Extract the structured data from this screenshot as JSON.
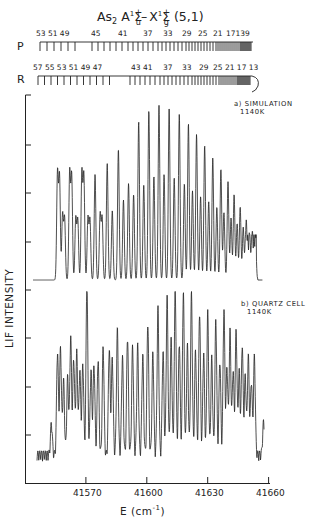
{
  "title": {
    "molecule": "As",
    "molecule_sub": "2",
    "upper_state": "A",
    "upper_mult": "1",
    "upper_sym": "Σ",
    "upper_sup": "+",
    "upper_sub": "u",
    "dash": "–",
    "lower_state": "X",
    "lower_mult": "1",
    "lower_sym": "Σ",
    "lower_sup": "+",
    "lower_sub": "g",
    "band": "(5,1)"
  },
  "chart_data": [
    {
      "type": "line",
      "title": "As2 A1Σu+ – X1Σg+ (5,1)",
      "panel": "a) SIMULATION 1140K",
      "xlabel": "E (cm-1)",
      "ylabel": "LIF INTENSITY",
      "xlim": [
        41540,
        41661
      ],
      "x_ticks": [
        41570,
        41600,
        41630,
        41660
      ],
      "grid": false,
      "band_head_cm": 41654,
      "description": "Resolved rotational lines of P and R branches; intensity rises toward ~41610 and decays into a congested band head near 41654",
      "peaks": [
        {
          "x": 41556,
          "y": 0.59
        },
        {
          "x": 41557,
          "y": 0.57
        },
        {
          "x": 41558.5,
          "y": 0.36
        },
        {
          "x": 41559.5,
          "y": 0.34
        },
        {
          "x": 41562,
          "y": 0.59
        },
        {
          "x": 41563,
          "y": 0.57
        },
        {
          "x": 41565,
          "y": 0.34
        },
        {
          "x": 41566,
          "y": 0.33
        },
        {
          "x": 41568,
          "y": 0.59
        },
        {
          "x": 41569,
          "y": 0.57
        },
        {
          "x": 41571,
          "y": 0.34
        },
        {
          "x": 41572,
          "y": 0.33
        },
        {
          "x": 41574.5,
          "y": 0.58
        },
        {
          "x": 41577,
          "y": 0.36
        },
        {
          "x": 41578,
          "y": 0.34
        },
        {
          "x": 41580.5,
          "y": 0.64
        },
        {
          "x": 41583,
          "y": 0.38
        },
        {
          "x": 41586,
          "y": 0.72
        },
        {
          "x": 41588.5,
          "y": 0.44
        },
        {
          "x": 41591,
          "y": 0.53
        },
        {
          "x": 41593.5,
          "y": 0.47
        },
        {
          "x": 41596,
          "y": 0.87
        },
        {
          "x": 41598.5,
          "y": 0.52
        },
        {
          "x": 41601,
          "y": 0.93
        },
        {
          "x": 41603.5,
          "y": 0.57
        },
        {
          "x": 41606,
          "y": 0.96
        },
        {
          "x": 41608.5,
          "y": 0.58
        },
        {
          "x": 41611,
          "y": 0.95
        },
        {
          "x": 41613.5,
          "y": 0.56
        },
        {
          "x": 41616,
          "y": 0.91
        },
        {
          "x": 41618.5,
          "y": 0.53
        },
        {
          "x": 41620.5,
          "y": 0.86
        },
        {
          "x": 41622.5,
          "y": 0.49
        },
        {
          "x": 41624.5,
          "y": 0.8
        },
        {
          "x": 41626.5,
          "y": 0.46
        },
        {
          "x": 41628.5,
          "y": 0.74
        },
        {
          "x": 41630.5,
          "y": 0.43
        },
        {
          "x": 41632.5,
          "y": 0.67
        },
        {
          "x": 41634.5,
          "y": 0.4
        },
        {
          "x": 41636.5,
          "y": 0.61
        },
        {
          "x": 41638,
          "y": 0.37
        },
        {
          "x": 41640,
          "y": 0.54
        },
        {
          "x": 41641.5,
          "y": 0.34
        },
        {
          "x": 41643,
          "y": 0.47
        },
        {
          "x": 41644.5,
          "y": 0.31
        },
        {
          "x": 41646,
          "y": 0.4
        },
        {
          "x": 41647.5,
          "y": 0.29
        },
        {
          "x": 41649,
          "y": 0.33
        },
        {
          "x": 41650.5,
          "y": 0.26
        },
        {
          "x": 41652,
          "y": 0.27
        },
        {
          "x": 41653.5,
          "y": 0.25
        }
      ]
    },
    {
      "type": "line",
      "panel": "b) QUARTZ CELL 1140K",
      "xlabel": "E (cm-1)",
      "ylabel": "LIF INTENSITY",
      "xlim": [
        41540,
        41661
      ],
      "x_ticks": [
        41570,
        41600,
        41630,
        41660
      ],
      "grid": false,
      "band_head_cm": 41654,
      "description": "Experimental LIF spectrum; noisier lines, strong isolated line near 41565, drop at band head then small feature near 41658",
      "peaks": [
        {
          "x": 41553,
          "y": 0.18
        },
        {
          "x": 41556,
          "y": 0.59
        },
        {
          "x": 41557.5,
          "y": 0.61
        },
        {
          "x": 41559,
          "y": 0.42
        },
        {
          "x": 41561,
          "y": 0.44
        },
        {
          "x": 41562.5,
          "y": 0.67
        },
        {
          "x": 41564,
          "y": 0.55
        },
        {
          "x": 41565.5,
          "y": 0.58
        },
        {
          "x": 41567,
          "y": 0.48
        },
        {
          "x": 41568.5,
          "y": 0.52
        },
        {
          "x": 41570.5,
          "y": 0.98
        },
        {
          "x": 41572.5,
          "y": 0.48
        },
        {
          "x": 41574,
          "y": 0.52
        },
        {
          "x": 41576,
          "y": 0.55
        },
        {
          "x": 41578.5,
          "y": 0.62
        },
        {
          "x": 41581.5,
          "y": 0.61
        },
        {
          "x": 41583,
          "y": 0.55
        },
        {
          "x": 41585.5,
          "y": 0.71
        },
        {
          "x": 41588,
          "y": 0.56
        },
        {
          "x": 41590.5,
          "y": 0.68
        },
        {
          "x": 41593,
          "y": 0.62
        },
        {
          "x": 41595.5,
          "y": 0.62
        },
        {
          "x": 41598,
          "y": 0.57
        },
        {
          "x": 41600.5,
          "y": 0.76
        },
        {
          "x": 41603,
          "y": 0.58
        },
        {
          "x": 41605.5,
          "y": 0.83
        },
        {
          "x": 41608,
          "y": 0.59
        },
        {
          "x": 41610,
          "y": 0.9
        },
        {
          "x": 41612,
          "y": 0.66
        },
        {
          "x": 41614,
          "y": 0.95
        },
        {
          "x": 41616,
          "y": 0.65
        },
        {
          "x": 41618,
          "y": 0.93
        },
        {
          "x": 41620,
          "y": 0.62
        },
        {
          "x": 41622,
          "y": 0.92
        },
        {
          "x": 41624,
          "y": 0.6
        },
        {
          "x": 41626,
          "y": 0.82
        },
        {
          "x": 41628,
          "y": 0.58
        },
        {
          "x": 41630,
          "y": 0.81
        },
        {
          "x": 41632,
          "y": 0.55
        },
        {
          "x": 41634,
          "y": 0.77
        },
        {
          "x": 41636,
          "y": 0.54
        },
        {
          "x": 41638,
          "y": 0.83
        },
        {
          "x": 41639.5,
          "y": 0.5
        },
        {
          "x": 41641,
          "y": 0.7
        },
        {
          "x": 41642.5,
          "y": 0.48
        },
        {
          "x": 41644,
          "y": 0.71
        },
        {
          "x": 41645.5,
          "y": 0.47
        },
        {
          "x": 41647,
          "y": 0.63
        },
        {
          "x": 41648.5,
          "y": 0.45
        },
        {
          "x": 41650,
          "y": 0.56
        },
        {
          "x": 41651.5,
          "y": 0.42
        },
        {
          "x": 41653,
          "y": 0.56
        },
        {
          "x": 41657.5,
          "y": 0.18
        }
      ]
    }
  ],
  "branches": {
    "P": {
      "label": "P",
      "numbers": [
        "53",
        "51",
        "49",
        "45",
        "41",
        "37",
        "33",
        "29",
        "25",
        "21",
        "17",
        "13",
        "9"
      ],
      "number_text": "53 51 49",
      "number_text_b": "45",
      "number_text_c": "41",
      "number_text_d": "37",
      "number_text_e": "33",
      "number_text_f": "29",
      "number_text_g": "25",
      "number_text_h": "21",
      "number_text_i": "17139"
    },
    "R": {
      "label": "R",
      "numbers": [
        "57",
        "55",
        "53",
        "51",
        "49",
        "47",
        "43",
        "41",
        "37",
        "33",
        "29",
        "25",
        "21",
        "17",
        "13"
      ],
      "number_text": "57 55 53 51 49 47",
      "number_text_b": "43 41",
      "number_text_c": "37",
      "number_text_d": "33",
      "number_text_e": "29",
      "number_text_f": "25 21 17 13"
    }
  },
  "panels": {
    "a": {
      "line1": "a) SIMULATION",
      "line2": "1140K"
    },
    "b": {
      "line1": "b) QUARTZ CELL",
      "line2": "1140K"
    }
  },
  "axes": {
    "ylabel": "LIF INTENSITY",
    "xlabel_main": "E (cm",
    "xlabel_sup": "-1",
    "xlabel_close": ")",
    "x_ticks": [
      "41570",
      "41600",
      "41630",
      "41660"
    ]
  },
  "colors": {
    "ink": "#222222",
    "background": "#ffffff"
  }
}
